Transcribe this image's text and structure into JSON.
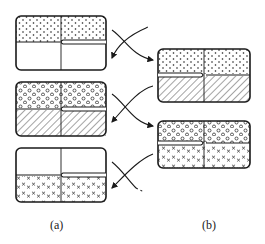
{
  "figure": {
    "panels": [
      {
        "label": "(a)",
        "boxes": [
          {
            "top_fill": "dots",
            "bottom_fill": "empty"
          },
          {
            "top_fill": "circles",
            "bottom_fill": "hatch"
          },
          {
            "top_fill": "empty",
            "bottom_fill": "crosses"
          }
        ]
      },
      {
        "label": "(b)",
        "boxes": [
          {
            "top_fill": "dots",
            "bottom_fill": "hatch"
          },
          {
            "top_fill": "circles",
            "bottom_fill": "crosses"
          }
        ]
      }
    ],
    "colors": {
      "ink": "#1a1a1a",
      "background": "#ffffff"
    }
  }
}
